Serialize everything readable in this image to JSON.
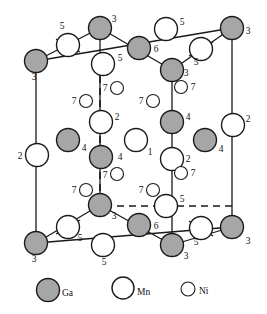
{
  "figure": {
    "colors": {
      "ga_fill": "#a6a6a6",
      "ga_stroke": "#1a1a1a",
      "mn_fill": "#ffffff",
      "mn_stroke": "#1a1a1a",
      "ni_fill": "#ffffff",
      "ni_stroke": "#1a1a1a",
      "cell_line": "#1a1a1a",
      "background": "#ffffff"
    },
    "radii": {
      "ga": 11.5,
      "mn": 11.5,
      "ni": 6.5
    },
    "cell": {
      "front_top_left": {
        "x": 100,
        "y": 28
      },
      "front_top_right": {
        "x": 172,
        "y": 70
      },
      "back_top_left": {
        "x": 36,
        "y": 61
      },
      "back_top_right": {
        "x": 232,
        "y": 28
      },
      "front_bottom_left": {
        "x": 100,
        "y": 205
      },
      "front_bottom_right": {
        "x": 172,
        "y": 245
      },
      "back_bottom_left": {
        "x": 36,
        "y": 243
      },
      "back_bottom_right": {
        "x": 232,
        "y": 227
      }
    },
    "atoms": [
      {
        "id": "ga-top-front-left",
        "type": "Ga",
        "x": 100,
        "y": 28,
        "label": "3",
        "lx": 114,
        "ly": 22
      },
      {
        "id": "ga-top-back-left",
        "type": "Ga",
        "x": 36,
        "y": 61,
        "label": "3",
        "lx": 34,
        "ly": 80
      },
      {
        "id": "ga-top-back-right",
        "type": "Ga",
        "x": 232,
        "y": 28,
        "label": "3",
        "lx": 248,
        "ly": 34
      },
      {
        "id": "ga-top-front-right",
        "type": "Ga",
        "x": 172,
        "y": 70,
        "label": "3",
        "lx": 186,
        "ly": 76
      },
      {
        "id": "ga-top-face-6",
        "type": "Ga",
        "x": 139,
        "y": 48,
        "label": "6",
        "lx": 156,
        "ly": 52
      },
      {
        "id": "mn-top-edge-5-left",
        "type": "Mn",
        "x": 68,
        "y": 45,
        "label": "5",
        "lx": 62,
        "ly": 29
      },
      {
        "id": "mn-top-edge-5-mid",
        "type": "Mn",
        "x": 103,
        "y": 64,
        "label": "5",
        "lx": 120,
        "ly": 61
      },
      {
        "id": "mn-top-edge-5-back",
        "type": "Mn",
        "x": 166,
        "y": 29,
        "label": "5",
        "lx": 182,
        "ly": 25
      },
      {
        "id": "mn-top-edge-5-right",
        "type": "Mn",
        "x": 201,
        "y": 49,
        "label": "5",
        "lx": 196,
        "ly": 65
      },
      {
        "id": "ni-7-a",
        "type": "Ni",
        "x": 117,
        "y": 88,
        "label": "7",
        "lx": 105,
        "ly": 91
      },
      {
        "id": "ni-7-b",
        "type": "Ni",
        "x": 86,
        "y": 101,
        "label": "7",
        "lx": 74,
        "ly": 104
      },
      {
        "id": "ni-7-c",
        "type": "Ni",
        "x": 153,
        "y": 101,
        "label": "7",
        "lx": 141,
        "ly": 104
      },
      {
        "id": "ni-7-d",
        "type": "Ni",
        "x": 181,
        "y": 87,
        "label": "7",
        "lx": 193,
        "ly": 90
      },
      {
        "id": "mn-2-center",
        "type": "Mn",
        "x": 101,
        "y": 122,
        "label": "2",
        "lx": 117,
        "ly": 120
      },
      {
        "id": "mn-2-left",
        "type": "Mn",
        "x": 37,
        "y": 155,
        "label": "2",
        "lx": 20,
        "ly": 159
      },
      {
        "id": "mn-2-right",
        "type": "Mn",
        "x": 233,
        "y": 125,
        "label": "2",
        "lx": 248,
        "ly": 122
      },
      {
        "id": "mn-2-front",
        "type": "Mn",
        "x": 172,
        "y": 159,
        "label": "2",
        "lx": 188,
        "ly": 162
      },
      {
        "id": "ga-4-left",
        "type": "Ga",
        "x": 68,
        "y": 140,
        "label": "4",
        "lx": 84,
        "ly": 151
      },
      {
        "id": "ga-4-center",
        "type": "Ga",
        "x": 101,
        "y": 157,
        "label": "4",
        "lx": 120,
        "ly": 160
      },
      {
        "id": "ga-4-rightin",
        "type": "Ga",
        "x": 172,
        "y": 122,
        "label": "4",
        "lx": 188,
        "ly": 120
      },
      {
        "id": "ga-4-right",
        "type": "Ga",
        "x": 205,
        "y": 140,
        "label": "4",
        "lx": 221,
        "ly": 152
      },
      {
        "id": "mn-1-center",
        "type": "Mn",
        "x": 136,
        "y": 140,
        "label": "1",
        "lx": 150,
        "ly": 155
      },
      {
        "id": "ni-7-e",
        "type": "Ni",
        "x": 117,
        "y": 174,
        "label": "7",
        "lx": 105,
        "ly": 178
      },
      {
        "id": "ni-7-f",
        "type": "Ni",
        "x": 86,
        "y": 190,
        "label": "7",
        "lx": 74,
        "ly": 193
      },
      {
        "id": "ni-7-g",
        "type": "Ni",
        "x": 153,
        "y": 190,
        "label": "7",
        "lx": 141,
        "ly": 193
      },
      {
        "id": "ni-7-h",
        "type": "Ni",
        "x": 181,
        "y": 173,
        "label": "7",
        "lx": 193,
        "ly": 176
      },
      {
        "id": "ga-bot-front-left",
        "type": "Ga",
        "x": 100,
        "y": 205,
        "label": "3",
        "lx": 114,
        "ly": 219
      },
      {
        "id": "ga-bot-back-left",
        "type": "Ga",
        "x": 36,
        "y": 243,
        "label": "3",
        "lx": 34,
        "ly": 262
      },
      {
        "id": "ga-bot-back-right",
        "type": "Ga",
        "x": 232,
        "y": 227,
        "label": "3",
        "lx": 248,
        "ly": 244
      },
      {
        "id": "ga-bot-front-right",
        "type": "Ga",
        "x": 172,
        "y": 245,
        "label": "3",
        "lx": 186,
        "ly": 259
      },
      {
        "id": "ga-bot-face-6",
        "type": "Ga",
        "x": 139,
        "y": 225,
        "label": "6",
        "lx": 156,
        "ly": 229
      },
      {
        "id": "mn-bot-5-left",
        "type": "Mn",
        "x": 68,
        "y": 227,
        "label": "5",
        "lx": 80,
        "ly": 241
      },
      {
        "id": "mn-bot-5-front",
        "type": "Mn",
        "x": 103,
        "y": 245,
        "label": "5",
        "lx": 104,
        "ly": 265
      },
      {
        "id": "mn-bot-5-mid",
        "type": "Mn",
        "x": 166,
        "y": 206,
        "label": "5",
        "lx": 182,
        "ly": 202
      },
      {
        "id": "mn-bot-5-right",
        "type": "Mn",
        "x": 201,
        "y": 228,
        "label": "5",
        "lx": 196,
        "ly": 245
      }
    ],
    "bonds": [
      {
        "id": "bond-tl-5",
        "x1": 80,
        "y1": 52,
        "x2": 56,
        "y2": 39
      },
      {
        "id": "bond-tr-5",
        "x1": 213,
        "y1": 42,
        "x2": 189,
        "y2": 56
      },
      {
        "id": "bond-bl-5",
        "x1": 80,
        "y1": 220,
        "x2": 56,
        "y2": 234
      },
      {
        "id": "bond-br-5",
        "x1": 213,
        "y1": 236,
        "x2": 189,
        "y2": 221
      }
    ],
    "dashed_lines": [
      {
        "id": "dash-vertical",
        "x1": 100,
        "y1": 64,
        "x2": 100,
        "y2": 205
      },
      {
        "id": "dash-horizontal",
        "x1": 105,
        "y1": 206,
        "x2": 232,
        "y2": 206
      }
    ],
    "legend": {
      "items": [
        {
          "id": "legend-ga",
          "symbol": "Ga",
          "type": "Ga",
          "cx": 48,
          "cy": 290,
          "r": 11.5,
          "tx": 62,
          "ty": 296
        },
        {
          "id": "legend-mn",
          "symbol": "Mn",
          "type": "Mn",
          "cx": 123,
          "cy": 288,
          "r": 11,
          "tx": 137,
          "ty": 295
        },
        {
          "id": "legend-ni",
          "symbol": "Ni",
          "type": "Ni",
          "cx": 188,
          "cy": 289,
          "r": 7,
          "tx": 199,
          "ty": 294
        }
      ]
    }
  }
}
